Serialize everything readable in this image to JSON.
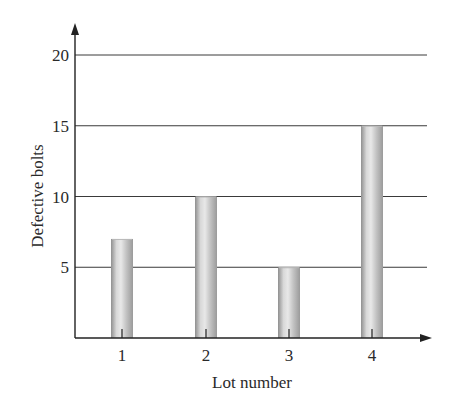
{
  "chart_data": {
    "type": "bar",
    "title": "",
    "xlabel": "Lot number",
    "ylabel": "Defective bolts",
    "categories": [
      "1",
      "2",
      "3",
      "4"
    ],
    "values": [
      7,
      10,
      5,
      15
    ],
    "ylim": [
      0,
      20
    ],
    "yticks": [
      5,
      10,
      15,
      20
    ],
    "grid": {
      "horizontal": true,
      "vertical": false
    },
    "legend": null,
    "bar_style": "cylindrical gray gradient"
  },
  "colors": {
    "axis": "#222222",
    "grid": "#3a3a3a",
    "bar_edge": "#8f8f8f",
    "bar_highlight": "#e6e6e6",
    "bar_mid": "#c4c4c4"
  }
}
